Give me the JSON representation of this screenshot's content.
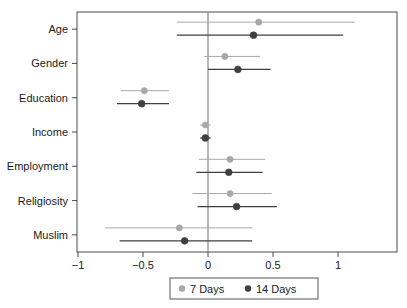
{
  "chart_data": {
    "type": "scatter",
    "subtype": "coefficient-forest-plot",
    "title": "",
    "xlabel": "",
    "ylabel": "",
    "xlim": [
      -1.13,
      1.13
    ],
    "xticks": [
      -1,
      -0.5,
      0,
      0.5,
      1
    ],
    "xtick_labels": [
      "−1",
      "−0.5",
      "0",
      "0.5",
      "1"
    ],
    "categories": [
      "Age",
      "Gender",
      "Education",
      "Income",
      "Employment",
      "Religiosity",
      "Muslim"
    ],
    "grid": false,
    "reference_line": 0,
    "legend_position": "bottom",
    "colors": {
      "series_7_days": "#a8a8a8",
      "series_14_days": "#3f3f3f",
      "axis": "#4a4a4a",
      "zero_line": "#7a7a7a",
      "background": "#ffffff"
    },
    "series": [
      {
        "name": "7 Days",
        "color": "#a8a8a8",
        "marker": "circle",
        "values": [
          0.39,
          0.13,
          -0.49,
          -0.02,
          0.17,
          0.17,
          -0.22
        ],
        "ci_low": [
          -0.24,
          -0.03,
          -0.67,
          -0.06,
          -0.07,
          -0.12,
          -0.79
        ],
        "ci_high": [
          1.13,
          0.4,
          -0.3,
          0.02,
          0.44,
          0.49,
          0.34
        ]
      },
      {
        "name": "14 Days",
        "color": "#3f3f3f",
        "marker": "circle",
        "values": [
          0.35,
          0.23,
          -0.51,
          -0.02,
          0.16,
          0.22,
          -0.18
        ],
        "ci_low": [
          -0.24,
          0.0,
          -0.7,
          -0.06,
          -0.09,
          -0.08,
          -0.68
        ],
        "ci_high": [
          1.04,
          0.48,
          -0.3,
          0.02,
          0.42,
          0.53,
          0.34
        ]
      }
    ]
  },
  "legend": {
    "items": [
      {
        "label": "7 Days",
        "color": "#a8a8a8"
      },
      {
        "label": "14 Days",
        "color": "#3f3f3f"
      }
    ]
  }
}
